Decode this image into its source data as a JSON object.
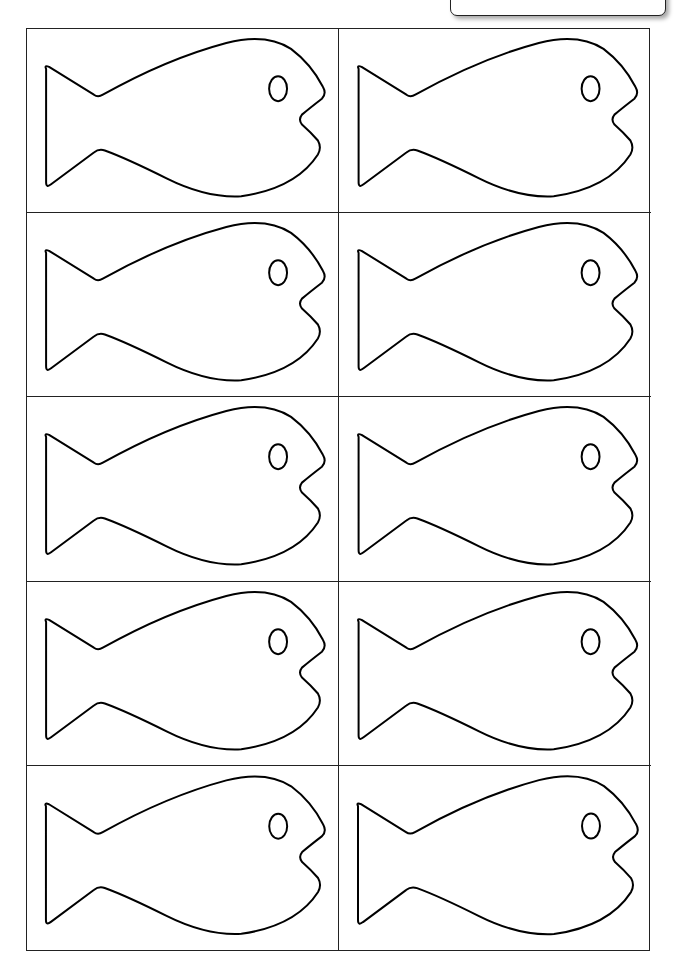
{
  "sheet": {
    "label": "GENERIC SHEET 5",
    "rows": 5,
    "columns": 2,
    "outline_color": "#000000",
    "label_text_color": "#c8c8c8"
  },
  "cells": [
    {
      "row": 1,
      "col": 1,
      "shape": "fish-outline"
    },
    {
      "row": 1,
      "col": 2,
      "shape": "fish-outline"
    },
    {
      "row": 2,
      "col": 1,
      "shape": "fish-outline"
    },
    {
      "row": 2,
      "col": 2,
      "shape": "fish-outline"
    },
    {
      "row": 3,
      "col": 1,
      "shape": "fish-outline"
    },
    {
      "row": 3,
      "col": 2,
      "shape": "fish-outline"
    },
    {
      "row": 4,
      "col": 1,
      "shape": "fish-outline"
    },
    {
      "row": 4,
      "col": 2,
      "shape": "fish-outline"
    },
    {
      "row": 5,
      "col": 1,
      "shape": "fish-outline"
    },
    {
      "row": 5,
      "col": 2,
      "shape": "fish-outline"
    }
  ]
}
